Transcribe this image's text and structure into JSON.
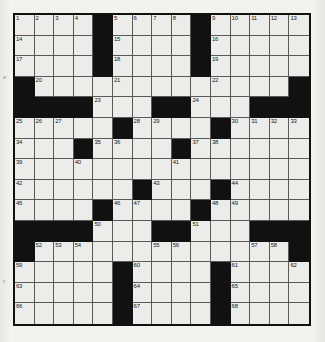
{
  "puzzle": {
    "type": "crossword-grid",
    "title": "Crossword Puzzle Grid",
    "rows": 15,
    "columns": 15,
    "colors": {
      "block": "#111111",
      "cell": "#ececea",
      "grid_line": "#5a5a58",
      "border": "#111111",
      "paper": "#f2f2ee",
      "number_text": "#1a1a1a"
    },
    "legend": {
      "block_symbol": "#",
      "open_symbol": "."
    },
    "grid": [
      "....#....#.....",
      "....#....#.....",
      "....#....#.....",
      "#.............#",
      "####...##...###",
      ".....#....#....",
      "...#....#......",
      "...............",
      "......#...#....",
      "....#....#.....",
      "####...##...###",
      "#.............#",
      ".....#....#....",
      ".....#....#....",
      ".....#....#...."
    ],
    "numbers": [
      {
        "row": 1,
        "col": 1,
        "label": "1"
      },
      {
        "row": 1,
        "col": 2,
        "label": "2"
      },
      {
        "row": 1,
        "col": 3,
        "label": "3"
      },
      {
        "row": 1,
        "col": 4,
        "label": "4"
      },
      {
        "row": 1,
        "col": 6,
        "label": "5"
      },
      {
        "row": 1,
        "col": 7,
        "label": "6"
      },
      {
        "row": 1,
        "col": 8,
        "label": "7"
      },
      {
        "row": 1,
        "col": 9,
        "label": "8"
      },
      {
        "row": 1,
        "col": 11,
        "label": "9"
      },
      {
        "row": 1,
        "col": 12,
        "label": "10"
      },
      {
        "row": 1,
        "col": 13,
        "label": "11"
      },
      {
        "row": 1,
        "col": 14,
        "label": "12"
      },
      {
        "row": 1,
        "col": 15,
        "label": "13"
      },
      {
        "row": 2,
        "col": 1,
        "label": "14"
      },
      {
        "row": 2,
        "col": 6,
        "label": "15"
      },
      {
        "row": 2,
        "col": 11,
        "label": "16"
      },
      {
        "row": 3,
        "col": 1,
        "label": "17"
      },
      {
        "row": 3,
        "col": 6,
        "label": "18"
      },
      {
        "row": 3,
        "col": 11,
        "label": "19"
      },
      {
        "row": 4,
        "col": 2,
        "label": "20"
      },
      {
        "row": 4,
        "col": 6,
        "label": "21"
      },
      {
        "row": 4,
        "col": 11,
        "label": "22"
      },
      {
        "row": 5,
        "col": 5,
        "label": "23"
      },
      {
        "row": 5,
        "col": 10,
        "label": "24"
      },
      {
        "row": 6,
        "col": 1,
        "label": "25"
      },
      {
        "row": 6,
        "col": 2,
        "label": "26"
      },
      {
        "row": 6,
        "col": 3,
        "label": "27"
      },
      {
        "row": 6,
        "col": 7,
        "label": "28"
      },
      {
        "row": 6,
        "col": 8,
        "label": "29"
      },
      {
        "row": 6,
        "col": 12,
        "label": "30"
      },
      {
        "row": 6,
        "col": 13,
        "label": "31"
      },
      {
        "row": 6,
        "col": 14,
        "label": "32"
      },
      {
        "row": 6,
        "col": 15,
        "label": "33"
      },
      {
        "row": 7,
        "col": 1,
        "label": "34"
      },
      {
        "row": 7,
        "col": 5,
        "label": "35"
      },
      {
        "row": 7,
        "col": 6,
        "label": "36"
      },
      {
        "row": 7,
        "col": 10,
        "label": "37"
      },
      {
        "row": 7,
        "col": 11,
        "label": "38"
      },
      {
        "row": 8,
        "col": 1,
        "label": "39"
      },
      {
        "row": 8,
        "col": 4,
        "label": "40"
      },
      {
        "row": 8,
        "col": 9,
        "label": "41"
      },
      {
        "row": 9,
        "col": 1,
        "label": "42"
      },
      {
        "row": 9,
        "col": 8,
        "label": "43"
      },
      {
        "row": 9,
        "col": 12,
        "label": "44"
      },
      {
        "row": 10,
        "col": 1,
        "label": "45"
      },
      {
        "row": 10,
        "col": 6,
        "label": "46"
      },
      {
        "row": 10,
        "col": 7,
        "label": "47"
      },
      {
        "row": 10,
        "col": 11,
        "label": "48"
      },
      {
        "row": 10,
        "col": 12,
        "label": "49"
      },
      {
        "row": 11,
        "col": 5,
        "label": "50"
      },
      {
        "row": 11,
        "col": 10,
        "label": "51"
      },
      {
        "row": 12,
        "col": 2,
        "label": "52"
      },
      {
        "row": 12,
        "col": 3,
        "label": "53"
      },
      {
        "row": 12,
        "col": 4,
        "label": "54"
      },
      {
        "row": 12,
        "col": 8,
        "label": "55"
      },
      {
        "row": 12,
        "col": 9,
        "label": "56"
      },
      {
        "row": 12,
        "col": 13,
        "label": "57"
      },
      {
        "row": 12,
        "col": 14,
        "label": "58"
      },
      {
        "row": 13,
        "col": 1,
        "label": "59"
      },
      {
        "row": 13,
        "col": 7,
        "label": "60"
      },
      {
        "row": 13,
        "col": 12,
        "label": "61"
      },
      {
        "row": 13,
        "col": 15,
        "label": "62"
      },
      {
        "row": 14,
        "col": 1,
        "label": "63"
      },
      {
        "row": 14,
        "col": 7,
        "label": "64"
      },
      {
        "row": 14,
        "col": 12,
        "label": "65"
      },
      {
        "row": 15,
        "col": 1,
        "label": "66"
      },
      {
        "row": 15,
        "col": 7,
        "label": "67"
      },
      {
        "row": 15,
        "col": 12,
        "label": "68"
      }
    ]
  },
  "margin": {
    "marks": [
      {
        "text": "e",
        "top": 74
      },
      {
        "text": "r",
        "top": 278
      }
    ]
  }
}
